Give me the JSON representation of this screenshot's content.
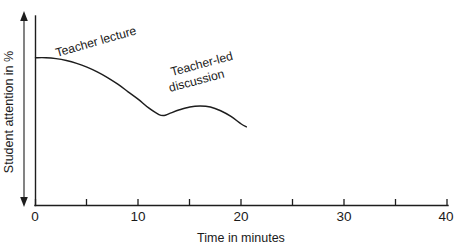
{
  "chart_data": {
    "type": "line",
    "title": "",
    "subtitle": "",
    "xlabel": "Time in minutes",
    "ylabel": "Student attention in %",
    "xlim": [
      0,
      40
    ],
    "ylim": [
      0,
      100
    ],
    "grid": false,
    "legend_position": "none",
    "x_ticks_major": [
      0,
      10,
      20,
      30,
      40
    ],
    "x_tick_labels": [
      "0",
      "10",
      "20",
      "30",
      "40"
    ],
    "x_ticks_minor": [
      5,
      15,
      25,
      35
    ],
    "y_ticks": [],
    "y_tick_labels": [],
    "y_axis_indicator": "double-headed-vertical-arrow",
    "series": [
      {
        "name": "Student attention",
        "x": [
          0,
          1,
          2,
          3,
          4,
          5,
          6,
          7,
          8,
          9,
          10,
          11,
          12,
          12.5,
          13,
          14,
          15,
          16,
          17,
          18,
          19,
          20,
          20.5
        ],
        "y": [
          78,
          78,
          77.5,
          76.5,
          75,
          73,
          70.5,
          67.5,
          64,
          60,
          56,
          51.5,
          48,
          47.5,
          48.5,
          50.5,
          52,
          52.5,
          52,
          50,
          47,
          43,
          41.5
        ]
      }
    ],
    "annotations": [
      {
        "id": "teacher-lecture",
        "text": "Teacher lecture",
        "lines": [
          "Teacher lecture"
        ],
        "x_minutes": 2.0,
        "rotation_degrees": -16
      },
      {
        "id": "teacher-led-discussion",
        "text": "Teacher-led discussion",
        "lines": [
          "Teacher-led",
          "discussion"
        ],
        "x_minutes": 13.0,
        "rotation_degrees": -15
      }
    ],
    "colors": {
      "background": "#ffffff",
      "axis": "#1d1d1d",
      "curve": "#1d1d1d",
      "text": "#1a1a1a"
    }
  },
  "figure": {
    "alt_description": "Line chart of student attention in percent over time in minutes"
  }
}
